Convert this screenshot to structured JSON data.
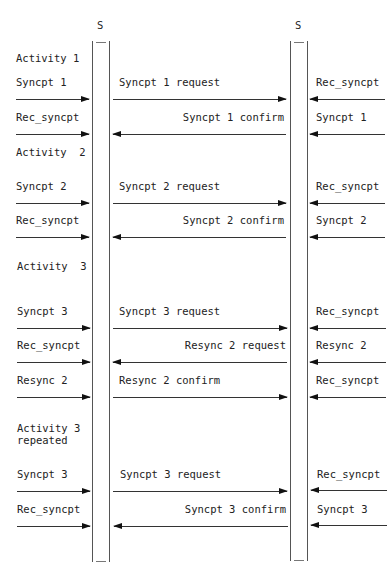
{
  "entities": {
    "left": "S",
    "right": "S"
  },
  "activities": [
    "Activity 1",
    "Activity  2",
    "Activity  3",
    "Activity 3",
    "repeated"
  ],
  "rows": [
    {
      "left": "Syncpt 1",
      "middle": "Syncpt 1 request",
      "middle_dir": "right",
      "right": "Rec_syncpt"
    },
    {
      "left": "Rec_syncpt",
      "middle": "Syncpt 1 confirm",
      "middle_dir": "left",
      "right": "Syncpt 1"
    },
    {
      "left": "Syncpt 2",
      "middle": "Syncpt 2 request",
      "middle_dir": "right",
      "right": "Rec_syncpt"
    },
    {
      "left": "Rec_syncpt",
      "middle": "Syncpt 2 confirm",
      "middle_dir": "left",
      "right": "Syncpt 2"
    },
    {
      "left": "Syncpt 3",
      "middle": "Syncpt 3 request",
      "middle_dir": "right",
      "right": "Rec_syncpt"
    },
    {
      "left": "Rec_syncpt",
      "middle": "Resync 2 request",
      "middle_dir": "left",
      "right": "Resync 2"
    },
    {
      "left": "Resync 2",
      "middle": "Resync 2 confirm",
      "middle_dir": "right",
      "right": "Rec_syncpt"
    },
    {
      "left": "Syncpt 3",
      "middle": "Syncpt 3 request",
      "middle_dir": "right",
      "right": "Rec_syncpt"
    },
    {
      "left": "Rec_syncpt",
      "middle": "Syncpt 3 confirm",
      "middle_dir": "left",
      "right": "Syncpt 3"
    }
  ]
}
